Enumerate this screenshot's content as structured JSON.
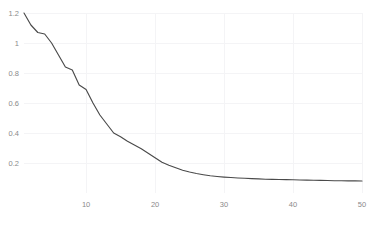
{
  "chart_data": {
    "type": "line",
    "title": "",
    "subtitle": "",
    "xlabel": "",
    "ylabel": "",
    "xlim": [
      1,
      50
    ],
    "ylim": [
      0,
      1.2
    ],
    "grid": true,
    "legend": null,
    "legend_position": "none",
    "colors": {
      "line": "#4a4a4a",
      "grid": "#f4f4f6",
      "tick_label": "#8a8a8a",
      "background": "#ffffff"
    },
    "xticks": [
      10,
      20,
      30,
      40,
      50
    ],
    "xtick_labels": [
      "10",
      "20",
      "30",
      "40",
      "50"
    ],
    "yticks": [
      0.2,
      0.4,
      0.6,
      0.8,
      1,
      1.2
    ],
    "ytick_labels": [
      "0.2",
      "0.4",
      "0.6",
      "0.8",
      "1",
      "1.2"
    ],
    "series": [
      {
        "name": "",
        "x": [
          1,
          2,
          3,
          4,
          5,
          6,
          7,
          8,
          9,
          10,
          11,
          12,
          13,
          14,
          15,
          16,
          17,
          18,
          19,
          20,
          21,
          22,
          23,
          24,
          25,
          26,
          27,
          28,
          29,
          30,
          31,
          32,
          33,
          34,
          35,
          36,
          37,
          38,
          39,
          40,
          41,
          42,
          43,
          44,
          45,
          46,
          47,
          48,
          49,
          50
        ],
        "values": [
          1.2,
          1.12,
          1.07,
          1.06,
          1.0,
          0.92,
          0.84,
          0.82,
          0.72,
          0.69,
          0.6,
          0.52,
          0.46,
          0.4,
          0.375,
          0.345,
          0.32,
          0.295,
          0.265,
          0.235,
          0.205,
          0.185,
          0.168,
          0.152,
          0.14,
          0.13,
          0.122,
          0.115,
          0.11,
          0.106,
          0.103,
          0.1,
          0.098,
          0.096,
          0.094,
          0.092,
          0.091,
          0.09,
          0.089,
          0.088,
          0.087,
          0.086,
          0.085,
          0.084,
          0.083,
          0.082,
          0.082,
          0.081,
          0.081,
          0.08
        ]
      }
    ]
  }
}
